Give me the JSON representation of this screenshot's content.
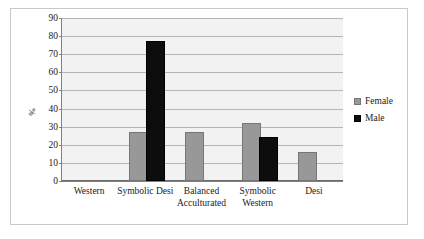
{
  "chart_data": {
    "type": "bar",
    "title": "",
    "subtitle": "",
    "xlabel": "",
    "ylabel": "%",
    "ylim": [
      0,
      90
    ],
    "ytick_step": 10,
    "yticks": [
      90,
      80,
      70,
      60,
      50,
      40,
      30,
      20,
      10,
      0
    ],
    "ytick_labels": [
      "90",
      "80",
      "70",
      "60",
      "50",
      "40",
      "30",
      "20",
      "10",
      "0"
    ],
    "grid": "horizontal",
    "legend_position": "right",
    "categories": [
      "Western",
      "Symbolic Desi",
      "Balanced\nAcculturated",
      "Symbolic\nWestern",
      "Desi"
    ],
    "series": [
      {
        "name": "Female",
        "color": "#989898",
        "values": [
          0,
          26,
          26,
          31,
          15
        ]
      },
      {
        "name": "Male",
        "color": "#0d0d0d",
        "values": [
          0,
          76,
          0,
          23,
          0
        ]
      }
    ],
    "annotations": []
  },
  "legend": {
    "items": [
      {
        "label": "Female",
        "swatch": "female"
      },
      {
        "label": "Male",
        "swatch": "male"
      }
    ]
  }
}
